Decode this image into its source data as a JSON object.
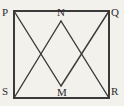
{
  "figure": {
    "type": "geometry-diagram",
    "background_color": "#f3f1ec",
    "stroke_color": "#3a3a3a",
    "label_color": "#2b2b2b",
    "square": {
      "name": "PQRS",
      "corners": [
        {
          "label": "P",
          "x": 14,
          "y": 11
        },
        {
          "label": "Q",
          "x": 109,
          "y": 11
        },
        {
          "label": "R",
          "x": 109,
          "y": 98
        },
        {
          "label": "S",
          "x": 14,
          "y": 98
        }
      ],
      "stroke_width": 2
    },
    "interior_points": [
      {
        "label": "N",
        "x": 61,
        "y": 21
      },
      {
        "label": "M",
        "x": 61,
        "y": 86
      }
    ],
    "segments": [
      {
        "name": "N-S",
        "from": "N",
        "to": "S",
        "x1": 61,
        "y1": 21,
        "x2": 14,
        "y2": 98
      },
      {
        "name": "N-R",
        "from": "N",
        "to": "R",
        "x1": 61,
        "y1": 21,
        "x2": 109,
        "y2": 98
      },
      {
        "name": "M-P",
        "from": "M",
        "to": "P",
        "x1": 61,
        "y1": 86,
        "x2": 14,
        "y2": 11
      },
      {
        "name": "M-Q",
        "from": "M",
        "to": "Q",
        "x1": 61,
        "y1": 86,
        "x2": 109,
        "y2": 11
      }
    ],
    "segment_stroke_width": 1.4,
    "labels": {
      "p": "P",
      "q": "Q",
      "r": "R",
      "s": "S",
      "n": "N",
      "m": "M"
    }
  }
}
